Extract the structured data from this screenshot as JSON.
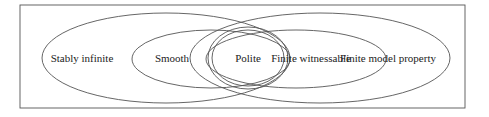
{
  "diagram": {
    "type": "venn",
    "frame": {
      "x": 20,
      "y": 5,
      "w": 445,
      "h": 103
    },
    "sets": [
      {
        "id": "stably-infinite",
        "label": "Stably infinite",
        "cx": 166,
        "cy": 58,
        "rx": 124,
        "ry": 45,
        "label_x": 82,
        "label_y": 62
      },
      {
        "id": "smooth",
        "label": "Smooth",
        "cx": 211,
        "cy": 59,
        "rx": 79,
        "ry": 29,
        "label_x": 172,
        "label_y": 62
      },
      {
        "id": "finite-model-property",
        "label": "Finite model property",
        "cx": 320,
        "cy": 58,
        "rx": 130,
        "ry": 45,
        "label_x": 388,
        "label_y": 62
      },
      {
        "id": "finite-witnessable",
        "label": "Finite witnessable",
        "cx": 296,
        "cy": 59,
        "rx": 90,
        "ry": 29,
        "label_x": 311,
        "label_y": 62
      },
      {
        "id": "polite",
        "label": "Polite",
        "cx": 248,
        "cy": 58,
        "rx": 36,
        "ry": 28,
        "outer_rx": 40,
        "outer_ry": 31,
        "label_x": 248,
        "label_y": 62
      }
    ],
    "colors": {
      "stroke": "#555555",
      "text": "#222222",
      "background": "#ffffff"
    }
  }
}
